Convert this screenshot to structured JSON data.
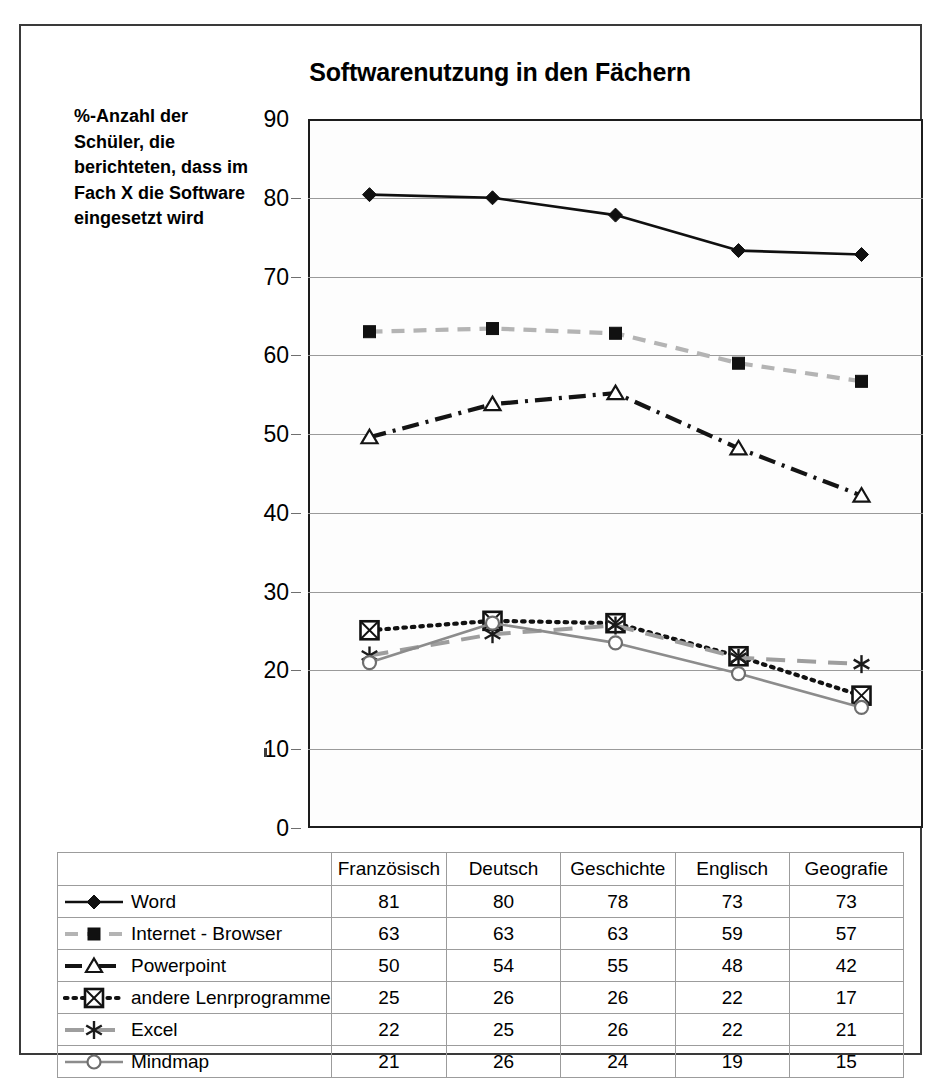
{
  "chart_data": {
    "type": "line",
    "title": "Softwarenutzung in den Fächern",
    "ylabel": "%-Anzahl der Schüler, die berichteten, dass im Fach X die Software eingesetzt wird",
    "xlabel": "",
    "categories": [
      "Französisch",
      "Deutsch",
      "Geschichte",
      "Englisch",
      "Geografie"
    ],
    "ylim": [
      0,
      90
    ],
    "ytick_step": 10,
    "yticks": [
      "0",
      "10",
      "20",
      "30",
      "40",
      "50",
      "60",
      "70",
      "80",
      "90"
    ],
    "grid": true,
    "legend_position": "table-left-column",
    "series": [
      {
        "name": "Word",
        "values": [
          81,
          80,
          78,
          73,
          73
        ],
        "plotted": [
          80.4,
          80.0,
          77.8,
          73.3,
          72.8
        ],
        "color": "#101010",
        "line_style": "solid",
        "marker": "filled-diamond"
      },
      {
        "name": "Internet - Browser",
        "values": [
          63,
          63,
          63,
          59,
          57
        ],
        "plotted": [
          63.0,
          63.4,
          62.8,
          59.0,
          56.7
        ],
        "color": "#b4b4b4",
        "marker_color": "#111111",
        "line_style": "dashed",
        "marker": "filled-square"
      },
      {
        "name": "Powerpoint",
        "values": [
          50,
          54,
          55,
          48,
          42
        ],
        "plotted": [
          49.6,
          53.8,
          55.2,
          48.2,
          42.2
        ],
        "color": "#141414",
        "line_style": "dash-dot",
        "marker": "open-triangle"
      },
      {
        "name": "andere Lenrprogramme",
        "values": [
          25,
          26,
          26,
          22,
          17
        ],
        "plotted": [
          25.1,
          26.3,
          26.0,
          21.8,
          16.8
        ],
        "color": "#121212",
        "line_style": "dotted",
        "marker": "boxed-x"
      },
      {
        "name": "Excel",
        "values": [
          22,
          25,
          26,
          22,
          21
        ],
        "plotted": [
          21.9,
          24.6,
          25.7,
          21.6,
          20.8
        ],
        "color": "#9e9e9e",
        "marker_color": "#1a1a1a",
        "line_style": "long-dash",
        "marker": "asterisk"
      },
      {
        "name": "Mindmap",
        "values": [
          21,
          26,
          24,
          19,
          15
        ],
        "plotted": [
          21.0,
          26.0,
          23.5,
          19.6,
          15.3
        ],
        "color": "#8c8c8c",
        "marker_color": "#6e6e6e",
        "line_style": "solid",
        "marker": "open-circle"
      }
    ]
  },
  "table": {
    "header_corner": "",
    "columns": [
      "Französisch",
      "Deutsch",
      "Geschichte",
      "Englisch",
      "Geografie"
    ],
    "rows": [
      {
        "label": "Word",
        "marker": "filled-diamond",
        "values": [
          "81",
          "80",
          "78",
          "73",
          "73"
        ]
      },
      {
        "label": "Internet - Browser",
        "marker": "filled-square",
        "values": [
          "63",
          "63",
          "63",
          "59",
          "57"
        ]
      },
      {
        "label": "Powerpoint",
        "marker": "open-triangle",
        "values": [
          "50",
          "54",
          "55",
          "48",
          "42"
        ]
      },
      {
        "label": "andere Lenrprogramme",
        "marker": "boxed-x",
        "values": [
          "25",
          "26",
          "26",
          "22",
          "17"
        ]
      },
      {
        "label": "Excel",
        "marker": "asterisk",
        "values": [
          "22",
          "25",
          "26",
          "22",
          "21"
        ]
      },
      {
        "label": "Mindmap",
        "marker": "open-circle",
        "values": [
          "21",
          "26",
          "24",
          "19",
          "15"
        ]
      }
    ]
  }
}
